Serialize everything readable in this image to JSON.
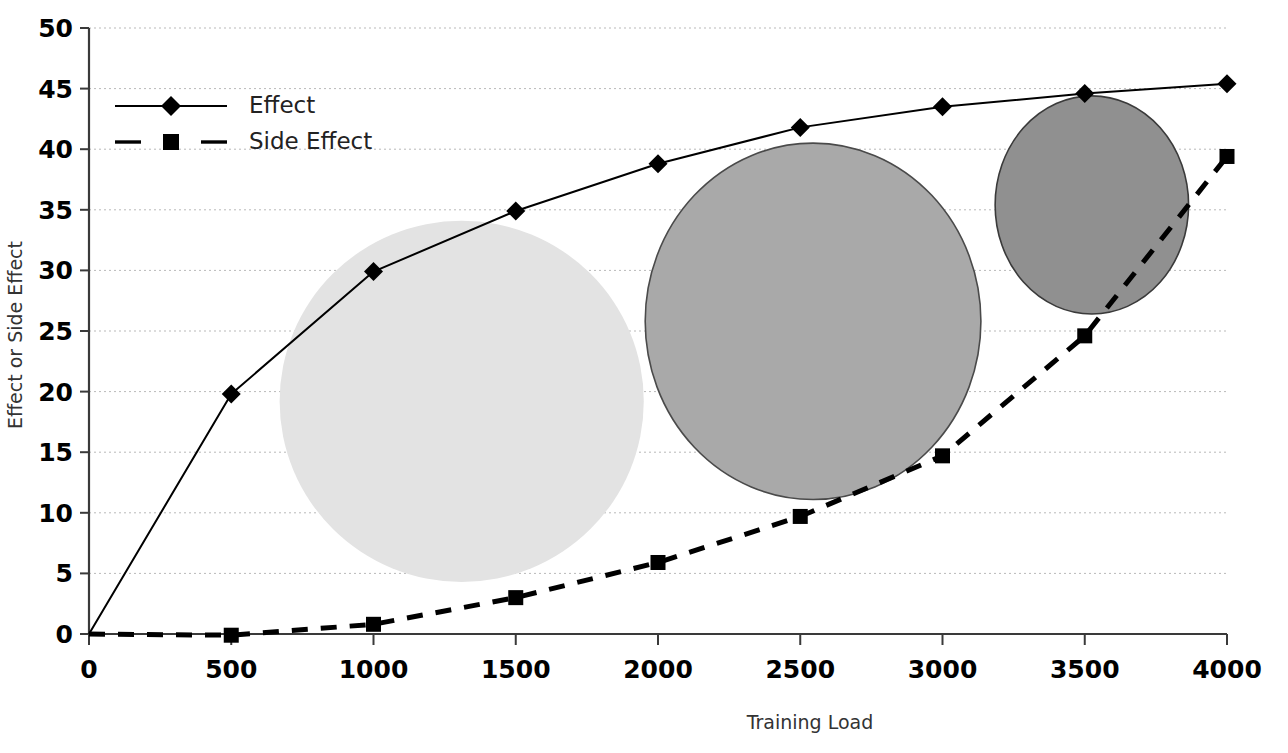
{
  "chart_data": {
    "type": "line",
    "title": "",
    "xlabel": "Training Load",
    "ylabel": "Effect or Side Effect",
    "x": [
      0,
      500,
      1000,
      1500,
      2000,
      2500,
      3000,
      3500,
      4000
    ],
    "xlim": [
      0,
      4000
    ],
    "ylim": [
      0,
      50
    ],
    "xticks": [
      "0",
      "500",
      "1000",
      "1500",
      "2000",
      "2500",
      "3000",
      "3500",
      "4000"
    ],
    "yticks": [
      "0",
      "5",
      "10",
      "15",
      "20",
      "25",
      "30",
      "35",
      "40",
      "45",
      "50"
    ],
    "grid": "horizontal-dotted",
    "legend_position": "upper-left-inside",
    "series": [
      {
        "name": "Effect",
        "values": [
          0,
          19.8,
          29.9,
          34.9,
          38.8,
          41.8,
          43.5,
          44.6,
          45.4
        ],
        "line_style": "solid",
        "marker": "diamond",
        "color": "#000000"
      },
      {
        "name": "Side Effect",
        "values": [
          0,
          -0.1,
          0.8,
          3.0,
          5.9,
          9.7,
          14.7,
          24.6,
          39.4
        ],
        "line_style": "dashed",
        "marker": "square",
        "color": "#000000"
      }
    ],
    "annotations": [
      {
        "name": "ellipse-light",
        "shape": "ellipse",
        "cx": 1310,
        "cy": 19.2,
        "rx_units": 640,
        "ry_units": 14.9,
        "fill": "#e3e3e3",
        "stroke": "none"
      },
      {
        "name": "ellipse-medium",
        "shape": "ellipse",
        "cx": 2545,
        "cy": 25.8,
        "rx_units": 590,
        "ry_units": 14.7,
        "fill": "#a9a9a9",
        "stroke": "#4a4a4a"
      },
      {
        "name": "ellipse-dark",
        "shape": "ellipse",
        "cx": 3525,
        "cy": 35.4,
        "rx_units": 340,
        "ry_units": 9.0,
        "fill": "#909090",
        "stroke": "#3a3a3a"
      }
    ]
  },
  "legend": {
    "items": [
      {
        "label": "Effect"
      },
      {
        "label": "Side Effect"
      }
    ]
  },
  "axes": {
    "x_title": "Training Load",
    "y_title": "Effect or Side Effect"
  },
  "colors": {
    "background": "#ffffff",
    "axis": "#3a3a3a",
    "grid": "#b9b9b9",
    "series": "#000000",
    "ellipse_light": "#e3e3e3",
    "ellipse_medium": "#a9a9a9",
    "ellipse_dark": "#909090"
  }
}
